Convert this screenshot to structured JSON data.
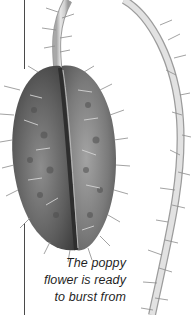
{
  "figure": {
    "icon": "poppy-bud-illustration",
    "colors": {
      "background": "#ffffff",
      "pod_dark": "#3f3f3f",
      "pod_mid": "#6e6e6e",
      "pod_light": "#9a9a9a",
      "stem": "#d6d6d6",
      "stem_edge": "#9c9c9c",
      "hair": "#8a8a8a",
      "rule": "#4a4a4a",
      "caption_text": "#1f1f1f"
    }
  },
  "caption": {
    "lines": [
      "The poppy",
      "flower is ready",
      "to burst from"
    ]
  }
}
